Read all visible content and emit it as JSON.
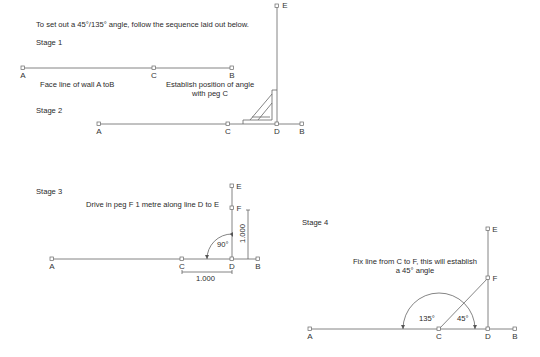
{
  "intro": "To set out a 45°/135° angle, follow the sequence laid out below.",
  "stages": [
    {
      "title": "Stage 1",
      "notes": [
        "Face line of wall A toB",
        "Establish position of angle",
        "with peg C"
      ],
      "points": {
        "A": "A",
        "C": "C",
        "B": "B",
        "E": "E"
      }
    },
    {
      "title": "Stage 2",
      "points": {
        "A": "A",
        "C": "C",
        "D": "D",
        "B": "B"
      }
    },
    {
      "title": "Stage 3",
      "note": "Drive in peg F 1 metre along line D to E",
      "angle": "90°",
      "dim_vertical": "1.000",
      "dim_horizontal": "1.000",
      "points": {
        "A": "A",
        "C": "C",
        "D": "D",
        "B": "B",
        "E": "E",
        "F": "F"
      }
    },
    {
      "title": "Stage 4",
      "notes": [
        "Fix line from C to F, this will establish",
        "a 45° angle"
      ],
      "angle_obtuse": "135°",
      "angle_acute": "45°",
      "points": {
        "A": "A",
        "C": "C",
        "D": "D",
        "B": "B",
        "E": "E",
        "F": "F"
      }
    }
  ],
  "colors": {
    "line": "#555555",
    "text": "#2a2a2a"
  }
}
